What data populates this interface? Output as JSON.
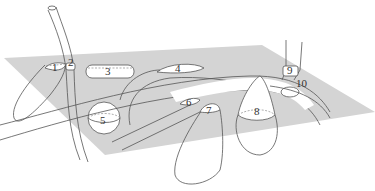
{
  "diagram": {
    "title": "",
    "plane_color": "#d4d4d4",
    "line_color": "#555555",
    "labels": [
      {
        "id": "1",
        "text": "1"
      },
      {
        "id": "2",
        "text": "2"
      },
      {
        "id": "3",
        "text": "3"
      },
      {
        "id": "4",
        "text": "4"
      },
      {
        "id": "5",
        "text": "5"
      },
      {
        "id": "6",
        "text": "6"
      },
      {
        "id": "7",
        "text": "7"
      },
      {
        "id": "8",
        "text": "8"
      },
      {
        "id": "9",
        "text": "9"
      },
      {
        "id": "10",
        "text": "10"
      }
    ]
  }
}
